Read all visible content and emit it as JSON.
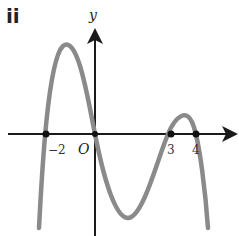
{
  "part_label": "ii",
  "axes": {
    "x_label": "x",
    "y_label": "y",
    "origin_label": "O"
  },
  "roots": [
    {
      "x": -2,
      "label": "−2"
    },
    {
      "x": 0,
      "label": ""
    },
    {
      "x": 3,
      "label": "3"
    },
    {
      "x": 4,
      "label": "4"
    }
  ],
  "colors": {
    "curve": "#8a8a8a",
    "axes": "#1a1a1a",
    "points": "#111111"
  }
}
